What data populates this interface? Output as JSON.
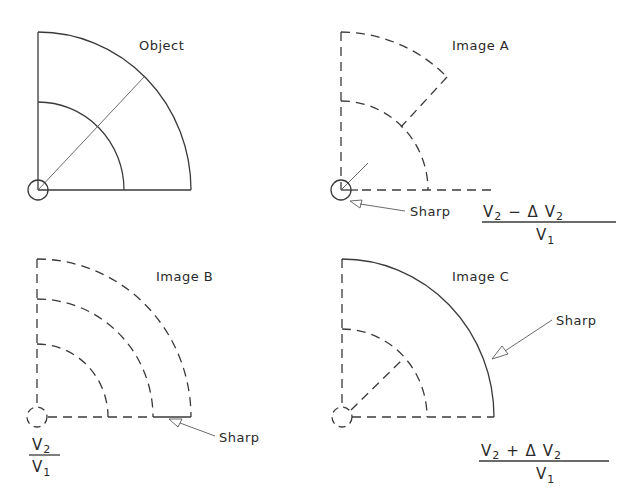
{
  "panels": {
    "object": {
      "title": "Object"
    },
    "image_a": {
      "title": "Image A",
      "sharp_label": "Sharp",
      "ratio": {
        "numerator": "V2 − Δ V2",
        "num_main": "V",
        "num_sub": "2",
        "num_op": "−  Δ V",
        "num_sub2": "2",
        "denominator_main": "V",
        "denominator_sub": "1"
      }
    },
    "image_b": {
      "title": "Image B",
      "sharp_label": "Sharp",
      "ratio": {
        "num_main": "V",
        "num_sub": "2",
        "denominator_main": "V",
        "denominator_sub": "1"
      }
    },
    "image_c": {
      "title": "Image C",
      "sharp_label": "Sharp",
      "ratio": {
        "numerator": "V2 + Δ V2",
        "num_main": "V",
        "num_sub": "2",
        "num_op": "+  Δ  V",
        "num_sub2": "2",
        "denominator_main": "V",
        "denominator_sub": "1"
      }
    }
  },
  "colors": {
    "line": "#3a3a3a",
    "background": "#ffffff"
  }
}
